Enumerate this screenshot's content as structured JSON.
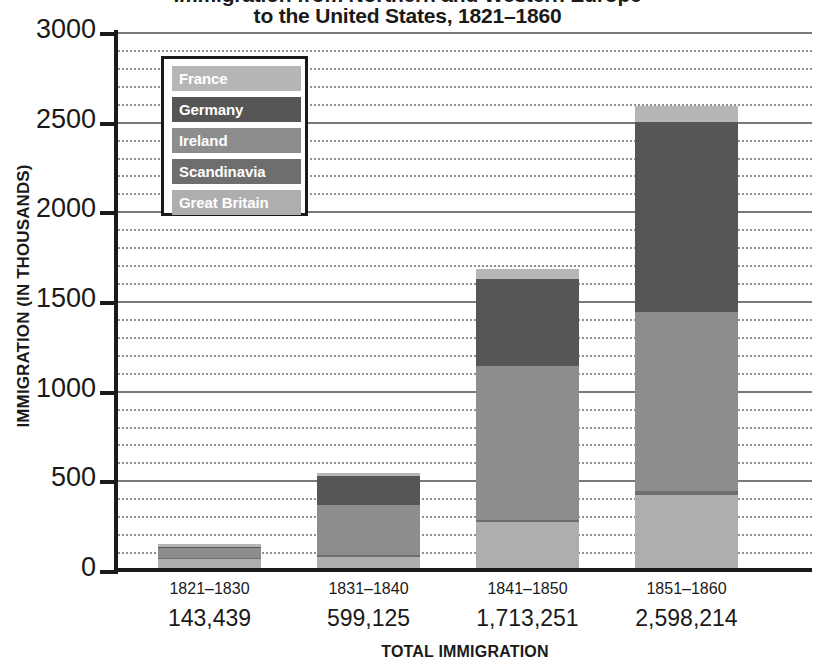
{
  "chart_data": {
    "type": "bar",
    "subtype": "stacked-bar",
    "title_line1": "Immigration from Northern and Western Europe",
    "title_line2": "to the United States, 1821–1860",
    "xlabel": "TOTAL IMMIGRATION",
    "ylabel": "IMMIGRATION (IN THOUSANDS)",
    "categories": [
      "1821–1830",
      "1831–1840",
      "1841–1850",
      "1851–1860"
    ],
    "totals": [
      "143,439",
      "599,125",
      "1,713,251",
      "2,598,214"
    ],
    "ylim": [
      0,
      3000
    ],
    "yticks": [
      0,
      500,
      1000,
      1500,
      2000,
      2500,
      3000
    ],
    "ytick_labels": [
      "0",
      "500",
      "1000",
      "1500",
      "2000",
      "2500",
      "3000"
    ],
    "minor_tick_step": 100,
    "grid": true,
    "legend_position": "upper-left-inside",
    "stack_order_bottom_to_top": [
      "Great Britain",
      "Scandinavia",
      "Ireland",
      "Germany",
      "France"
    ],
    "series": [
      {
        "name": "Great Britain",
        "color": "#aeaeae",
        "values": [
          60,
          75,
          265,
          420
        ]
      },
      {
        "name": "Scandinavia",
        "color": "#6e6e6e",
        "values": [
          5,
          10,
          15,
          20
        ]
      },
      {
        "name": "Ireland",
        "color": "#8d8d8d",
        "values": [
          55,
          280,
          860,
          1000
        ]
      },
      {
        "name": "Germany",
        "color": "#565656",
        "values": [
          10,
          160,
          480,
          1060
        ]
      },
      {
        "name": "France",
        "color": "#b6b6b6",
        "values": [
          13,
          15,
          60,
          90
        ]
      }
    ],
    "bar_tops": [
      143,
      540,
      1680,
      2590
    ]
  },
  "legend": {
    "items": [
      {
        "label": "France",
        "color": "#b6b6b6"
      },
      {
        "label": "Germany",
        "color": "#565656"
      },
      {
        "label": "Ireland",
        "color": "#8d8d8d"
      },
      {
        "label": "Scandinavia",
        "color": "#6e6e6e"
      },
      {
        "label": "Great Britain",
        "color": "#aeaeae"
      }
    ]
  },
  "colors": {
    "axis": "#1a1a1a",
    "gridline_major": "#77797c",
    "gridline_minor": "#8d9094",
    "background": "#ffffff"
  }
}
